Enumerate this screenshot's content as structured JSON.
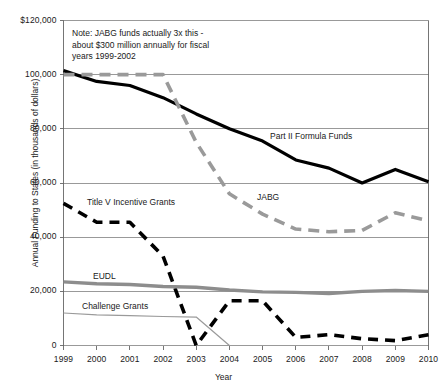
{
  "chart_data": {
    "type": "line",
    "title": "",
    "xlabel": "Year",
    "ylabel": "Annual Funding to States (in thousands of dollars)",
    "x": [
      1999,
      2000,
      2001,
      2002,
      2003,
      2004,
      2005,
      2006,
      2007,
      2008,
      2009,
      2010
    ],
    "categories": [
      "1999",
      "2000",
      "2001",
      "2002",
      "2003",
      "2004",
      "2005",
      "2006",
      "2007",
      "2008",
      "2009",
      "2010"
    ],
    "xlim": [
      1999,
      2010
    ],
    "ylim": [
      0,
      120000
    ],
    "ytick_labels": [
      "$120,000",
      "100,000",
      "80,000",
      "60,000",
      "40,000",
      "20,000",
      "0"
    ],
    "ytick_values": [
      120000,
      100000,
      80000,
      60000,
      40000,
      20000,
      0
    ],
    "grid": "horizontal",
    "legend": "inline-labels",
    "annotation": {
      "line1": "Note: JABG funds actually 3x this -",
      "line2": "about $300 million annually for fiscal",
      "line3": "years 1999-2002"
    },
    "series": [
      {
        "name": "Part II Formula Funds",
        "label": "Part II Formula Funds",
        "color": "#000000",
        "style": "solid",
        "width": 3.2,
        "values": [
          101500,
          97500,
          96000,
          91500,
          85500,
          80000,
          75500,
          68500,
          65500,
          60000,
          65000,
          60500
        ]
      },
      {
        "name": "JABG",
        "label": "JABG",
        "color": "#9a9a9a",
        "style": "dashed",
        "width": 3.6,
        "values": [
          100000,
          100000,
          100000,
          100000,
          75000,
          56000,
          48500,
          43000,
          42000,
          42500,
          49000,
          46000
        ]
      },
      {
        "name": "Title V Incentive Grants",
        "label": "Title V Incentive Grants",
        "color": "#000000",
        "style": "dashed",
        "width": 3.6,
        "values": [
          52500,
          45500,
          45500,
          33000,
          0,
          16500,
          16500,
          3000,
          4000,
          2500,
          1800,
          4000
        ]
      },
      {
        "name": "EUDL",
        "label": "EUDL",
        "color": "#8d8d8d",
        "style": "solid-thick",
        "width": 3.4,
        "values": [
          23500,
          22800,
          22500,
          21800,
          21500,
          20500,
          19800,
          19600,
          19200,
          20000,
          20300,
          20000
        ]
      },
      {
        "name": "Challenge Grants",
        "label": "Challenge Grants",
        "color": "#9a9a9a",
        "style": "thin",
        "width": 1.2,
        "values": [
          12000,
          11300,
          11000,
          10700,
          10500,
          0,
          null,
          null,
          null,
          null,
          null,
          null
        ]
      }
    ]
  }
}
